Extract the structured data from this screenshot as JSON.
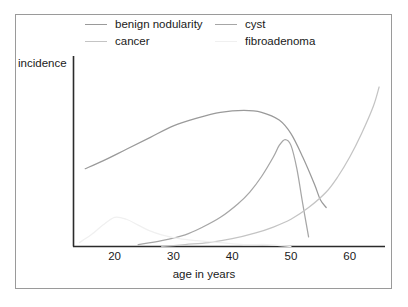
{
  "chart_data": {
    "type": "line",
    "title": "",
    "xlabel": "age in years",
    "ylabel": "incidence",
    "xlim": [
      13,
      66
    ],
    "ylim": [
      0,
      100
    ],
    "grid": false,
    "legend_position": "top",
    "xticks": [
      20,
      30,
      40,
      50,
      60
    ],
    "xtick_labels": [
      "20",
      "30",
      "40",
      "50",
      "60"
    ],
    "yticks": [],
    "ytick_labels": [],
    "series": [
      {
        "name": "benign nodularity",
        "color": "#9a9a9a",
        "x": [
          15,
          18,
          22,
          26,
          30,
          34,
          38,
          42,
          45,
          48,
          50,
          52,
          54,
          55,
          56
        ],
        "y": [
          40,
          44,
          50,
          56,
          62,
          66,
          69,
          70,
          69,
          65,
          58,
          46,
          32,
          24,
          20
        ]
      },
      {
        "name": "cyst",
        "color": "#a6a6a6",
        "x": [
          24,
          28,
          32,
          35,
          38,
          41,
          43,
          45,
          47,
          48,
          49,
          50,
          51,
          52,
          53
        ],
        "y": [
          1,
          3,
          6,
          10,
          15,
          22,
          28,
          36,
          46,
          52,
          55,
          52,
          40,
          22,
          5
        ]
      },
      {
        "name": "cancer",
        "color": "#c4c4c4",
        "x": [
          28,
          32,
          36,
          40,
          44,
          47,
          50,
          53,
          56,
          58,
          60,
          62,
          64,
          65
        ],
        "y": [
          0,
          1,
          2,
          4,
          7,
          10,
          14,
          20,
          28,
          36,
          46,
          58,
          72,
          82
        ]
      },
      {
        "name": "fibroadenoma",
        "color": "#f0f0f0",
        "x": [
          14,
          16,
          18,
          20,
          22,
          24,
          26,
          28,
          31,
          34,
          38,
          42,
          46,
          50
        ],
        "y": [
          2,
          6,
          11,
          15,
          14,
          11,
          8,
          6,
          4,
          3,
          2,
          1,
          1,
          0
        ]
      }
    ]
  },
  "legend": {
    "columns": [
      {
        "entries": [
          {
            "label": "benign nodularity",
            "color": "#9a9a9a"
          },
          {
            "label": "cancer",
            "color": "#c4c4c4"
          }
        ]
      },
      {
        "entries": [
          {
            "label": "cyst",
            "color": "#a6a6a6"
          },
          {
            "label": "fibroadenoma",
            "color": "#f0f0f0"
          }
        ]
      }
    ]
  },
  "axes": {
    "y_axis_label": "incidence",
    "x_axis_label": "age in years",
    "axis_color": "#2b2b2b"
  },
  "frame": {
    "border_color": "#9a9a9a",
    "background": "#ffffff"
  }
}
